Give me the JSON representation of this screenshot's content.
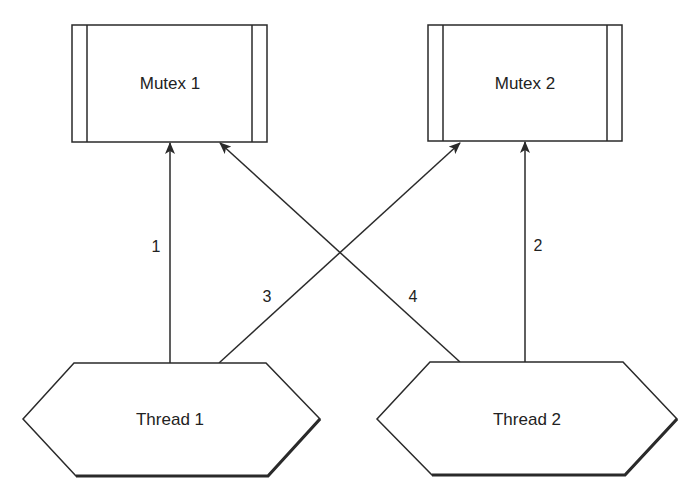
{
  "diagram": {
    "type": "deadlock",
    "colors": {
      "stroke": "#2a2a2a",
      "background": "#ffffff",
      "text": "#222222"
    },
    "mutexes": [
      {
        "id": "mutex1",
        "label": "Mutex 1"
      },
      {
        "id": "mutex2",
        "label": "Mutex 2"
      }
    ],
    "threads": [
      {
        "id": "thread1",
        "label": "Thread 1"
      },
      {
        "id": "thread2",
        "label": "Thread 2"
      }
    ],
    "edges": [
      {
        "label": "1",
        "from": "thread1",
        "to": "mutex1"
      },
      {
        "label": "2",
        "from": "thread2",
        "to": "mutex2"
      },
      {
        "label": "3",
        "from": "thread1",
        "to": "mutex2"
      },
      {
        "label": "4",
        "from": "thread2",
        "to": "mutex1"
      }
    ]
  }
}
